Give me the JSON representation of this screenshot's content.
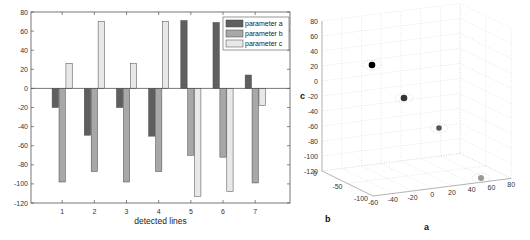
{
  "chart_data": [
    {
      "type": "bar",
      "title": "",
      "xlabel": "detected lines",
      "ylabel": "",
      "categories": [
        "1",
        "2",
        "3",
        "4",
        "5",
        "6",
        "7"
      ],
      "ylim": [
        -120,
        80
      ],
      "yticks": [
        -120,
        -100,
        -80,
        -60,
        -40,
        -20,
        0,
        20,
        40,
        60,
        80
      ],
      "grid": false,
      "legend_position": "top-right",
      "series": [
        {
          "name": "parameter a",
          "color": "#5f5f5f",
          "values": [
            -20,
            -49,
            -20,
            -50,
            71,
            69,
            14
          ]
        },
        {
          "name": "parameter b",
          "color": "#a8a8a8",
          "values": [
            -98,
            -87,
            -98,
            -87,
            -70,
            -72,
            -99
          ]
        },
        {
          "name": "parameter c",
          "color": "#e8e8e8",
          "values": [
            26,
            70,
            26,
            70,
            -113,
            -108,
            -18
          ]
        }
      ]
    },
    {
      "type": "scatter",
      "title": "",
      "projection": "3d",
      "xlabel": "a",
      "ylabel": "b",
      "zlabel": "c",
      "xlim": [
        -60,
        80
      ],
      "ylim": [
        -100,
        0
      ],
      "zlim": [
        -120,
        80
      ],
      "xticks": [
        -60,
        -40,
        -20,
        0,
        20,
        40,
        60,
        80
      ],
      "yticks": [
        -100,
        -50,
        0
      ],
      "zticks": [
        -120,
        -100,
        -80,
        -60,
        -40,
        -20,
        0,
        20,
        40,
        60,
        80
      ],
      "grid": true,
      "points": [
        {
          "a": -35,
          "b": -5,
          "c": 26,
          "color": "#000000",
          "label": "cluster 1"
        },
        {
          "a": -49,
          "b": -87,
          "c": 70,
          "color": "#333333",
          "label": "cluster 2"
        },
        {
          "a": 14,
          "b": -99,
          "c": -18,
          "color": "#555555",
          "label": "cluster 3"
        },
        {
          "a": 70,
          "b": -71,
          "c": -110,
          "color": "#999999",
          "label": "cluster 4"
        }
      ]
    }
  ]
}
